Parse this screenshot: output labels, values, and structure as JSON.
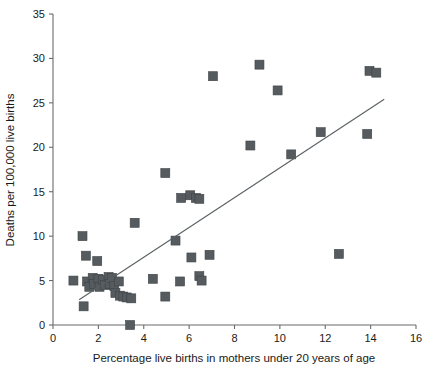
{
  "chart_data": {
    "type": "scatter",
    "title": "",
    "xlabel": "Percentage live births in mothers under 20 years of age",
    "ylabel": "Deaths per 100,000 live births",
    "xlim": [
      0,
      16
    ],
    "ylim": [
      0,
      35
    ],
    "xticks": [
      0,
      2,
      4,
      6,
      8,
      10,
      12,
      14,
      16
    ],
    "yticks": [
      0,
      5,
      10,
      15,
      20,
      25,
      30,
      35
    ],
    "xtick_labels": [
      "0",
      "2",
      "4",
      "6",
      "8",
      "10",
      "12",
      "14",
      "16"
    ],
    "ytick_labels": [
      "0",
      "5",
      "10",
      "15",
      "20",
      "25",
      "30",
      "35"
    ],
    "grid": false,
    "legend": null,
    "marker_shape": "square",
    "marker_color": "#555b5e",
    "points": [
      {
        "x": 0.9,
        "y": 5.0
      },
      {
        "x": 1.3,
        "y": 10.0
      },
      {
        "x": 1.35,
        "y": 2.1
      },
      {
        "x": 1.45,
        "y": 7.8
      },
      {
        "x": 1.5,
        "y": 4.9
      },
      {
        "x": 1.6,
        "y": 4.3
      },
      {
        "x": 1.75,
        "y": 5.3
      },
      {
        "x": 1.8,
        "y": 4.6
      },
      {
        "x": 1.95,
        "y": 7.2
      },
      {
        "x": 2.0,
        "y": 5.2
      },
      {
        "x": 2.05,
        "y": 4.3
      },
      {
        "x": 2.2,
        "y": 5.1
      },
      {
        "x": 2.3,
        "y": 4.5
      },
      {
        "x": 2.45,
        "y": 5.4
      },
      {
        "x": 2.5,
        "y": 4.6
      },
      {
        "x": 2.6,
        "y": 5.3
      },
      {
        "x": 2.7,
        "y": 4.4
      },
      {
        "x": 2.75,
        "y": 3.6
      },
      {
        "x": 2.9,
        "y": 4.9
      },
      {
        "x": 2.95,
        "y": 3.3
      },
      {
        "x": 3.1,
        "y": 3.2
      },
      {
        "x": 3.25,
        "y": 3.1
      },
      {
        "x": 3.4,
        "y": 0.0
      },
      {
        "x": 3.45,
        "y": 3.0
      },
      {
        "x": 3.6,
        "y": 11.5
      },
      {
        "x": 4.4,
        "y": 5.2
      },
      {
        "x": 4.95,
        "y": 17.1
      },
      {
        "x": 4.95,
        "y": 3.2
      },
      {
        "x": 5.4,
        "y": 9.5
      },
      {
        "x": 5.6,
        "y": 4.9
      },
      {
        "x": 5.65,
        "y": 14.3
      },
      {
        "x": 6.05,
        "y": 14.6
      },
      {
        "x": 6.1,
        "y": 7.6
      },
      {
        "x": 6.3,
        "y": 14.3
      },
      {
        "x": 6.45,
        "y": 14.2
      },
      {
        "x": 6.45,
        "y": 5.5
      },
      {
        "x": 6.55,
        "y": 5.0
      },
      {
        "x": 6.9,
        "y": 7.9
      },
      {
        "x": 7.05,
        "y": 28.0
      },
      {
        "x": 8.7,
        "y": 20.2
      },
      {
        "x": 9.1,
        "y": 29.3
      },
      {
        "x": 9.9,
        "y": 26.4
      },
      {
        "x": 10.5,
        "y": 19.2
      },
      {
        "x": 11.8,
        "y": 21.7
      },
      {
        "x": 12.6,
        "y": 8.0
      },
      {
        "x": 13.85,
        "y": 21.5
      },
      {
        "x": 13.95,
        "y": 28.6
      },
      {
        "x": 14.25,
        "y": 28.4
      }
    ],
    "fit_line": {
      "type": "linear-regression",
      "x_start": 1.15,
      "y_start": 2.85,
      "x_end": 14.6,
      "y_end": 25.4
    }
  }
}
